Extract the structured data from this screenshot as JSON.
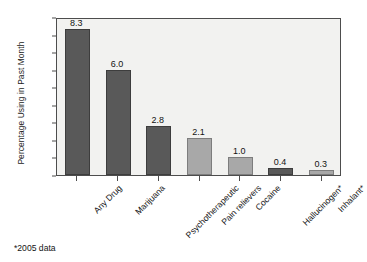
{
  "chart_data": {
    "type": "bar",
    "title": "",
    "xlabel": "",
    "ylabel": "Percentage Using in Past Month",
    "ylim": [
      0,
      9
    ],
    "ytick_step": 1,
    "grid": false,
    "legend": "none",
    "categories": [
      "Any Drug",
      "Marijuana",
      "Psychotherapeutic",
      "Pain relievers",
      "Cocaine",
      "Hallucinogen*",
      "Inhalant*"
    ],
    "values": [
      8.3,
      6.0,
      2.8,
      2.1,
      1.0,
      0.4,
      0.3
    ],
    "value_labels": [
      "8.3",
      "6.0",
      "2.8",
      "2.1",
      "1.0",
      "0.4",
      "0.3"
    ],
    "bar_colors": [
      "#595959",
      "#595959",
      "#595959",
      "#a8a8a8",
      "#a8a8a8",
      "#595959",
      "#a8a8a8"
    ],
    "ytick_labels": [
      "9.0",
      "8.0",
      "7.0",
      "6.0",
      "5.0",
      "4.0",
      "3.0",
      "2.0",
      "1.0",
      "0.0"
    ],
    "footnote": "*2005 data"
  },
  "colors": {
    "plot_background": "#f2f2f0",
    "axis": "#4d4d4d",
    "bar_dark": "#595959",
    "bar_light": "#a8a8a8",
    "text": "#141414"
  }
}
